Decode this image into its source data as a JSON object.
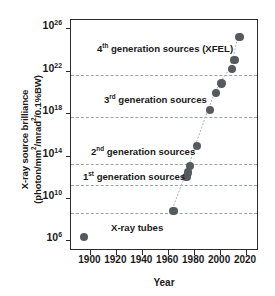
{
  "chart_data": {
    "type": "scatter",
    "title": "",
    "xlabel": "Year",
    "ylabel_line1": "X-ray source brilliance",
    "ylabel_line2": "(photon/mm2/mrad2/0.1%BW)",
    "xlim": [
      1885,
      2030
    ],
    "ylim_log10": [
      5.0,
      26.8
    ],
    "grid": "horizontal dashed gridlines",
    "legend": "none",
    "xticks": [
      1900,
      1920,
      1940,
      1960,
      1980,
      2000,
      2020
    ],
    "xtick_labels": [
      "1900",
      "1920",
      "1940",
      "1960",
      "1980",
      "2000",
      "2020"
    ],
    "yticks_log10": [
      6,
      10,
      14,
      18,
      22,
      26
    ],
    "ytick_labels": [
      "10",
      "10",
      "10",
      "10",
      "10",
      "10"
    ],
    "ytick_exponents": [
      "6",
      "10",
      "14",
      "18",
      "22",
      "26"
    ],
    "gridlines_log10": [
      8.6,
      11.2,
      13.2,
      17.6,
      21.6
    ],
    "marker_color": "#555a5e",
    "trend_line_color": "#9aa3b0",
    "points": [
      {
        "year": 1895,
        "log10_brilliance": 6.3
      },
      {
        "year": 1964,
        "log10_brilliance": 8.8
      },
      {
        "year": 1974,
        "log10_brilliance": 12.0
      },
      {
        "year": 1975,
        "log10_brilliance": 12.4
      },
      {
        "year": 1977,
        "log10_brilliance": 13.0
      },
      {
        "year": 1982,
        "log10_brilliance": 14.9
      },
      {
        "year": 1992,
        "log10_brilliance": 18.3
      },
      {
        "year": 1997,
        "log10_brilliance": 19.9
      },
      {
        "year": 2001,
        "log10_brilliance": 20.8
      },
      {
        "year": 2009,
        "log10_brilliance": 22.2
      },
      {
        "year": 2011,
        "log10_brilliance": 23.0
      },
      {
        "year": 2015,
        "log10_brilliance": 25.2
      }
    ],
    "annotations": [
      {
        "text_prefix": "4",
        "sup": "th",
        "text_suffix": " generation sources (XFEL)"
      },
      {
        "text_prefix": "3",
        "sup": "rd",
        "text_suffix": " generation sources"
      },
      {
        "text_prefix": "2",
        "sup": "nd",
        "text_suffix": " generation sources"
      },
      {
        "text_prefix": "1",
        "sup": "st",
        "text_suffix": " generation sources"
      },
      {
        "text_prefix": "X-ray tubes",
        "sup": "",
        "text_suffix": ""
      }
    ]
  },
  "axes": {
    "x_title": "Year",
    "y_title_line1": "X-ray source brilliance",
    "y_title_line2_a": "(photon/mm",
    "y_title_line2_b": "/mrad",
    "y_title_line2_c": "/0.1%BW)",
    "y_sup": "2"
  },
  "ann": {
    "gen4_num": "4",
    "gen4_sup": "th",
    "gen4_rest": " generation sources (XFEL)",
    "gen3_num": "3",
    "gen3_sup": "rd",
    "gen3_rest": " generation sources",
    "gen2_num": "2",
    "gen2_sup": "nd",
    "gen2_rest": " generation sources",
    "gen1_num": "1",
    "gen1_sup": "st",
    "gen1_rest": " generation sources",
    "tubes": "X-ray tubes"
  },
  "yticks": [
    {
      "mantissa": "10",
      "exp": "26"
    },
    {
      "mantissa": "10",
      "exp": "22"
    },
    {
      "mantissa": "10",
      "exp": "18"
    },
    {
      "mantissa": "10",
      "exp": "14"
    },
    {
      "mantissa": "10",
      "exp": "10"
    },
    {
      "mantissa": "10",
      "exp": "6"
    }
  ],
  "xticks": [
    "1900",
    "1920",
    "1940",
    "1960",
    "1980",
    "2000",
    "2020"
  ]
}
